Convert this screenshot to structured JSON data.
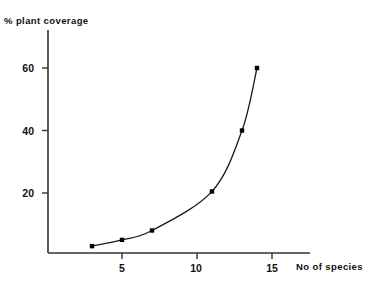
{
  "chart_data": {
    "type": "line",
    "title": "",
    "xlabel": "No of species",
    "ylabel": "% plant coverage",
    "xlim": [
      0,
      17.5
    ],
    "ylim": [
      0,
      72
    ],
    "xticks": [
      5,
      10,
      15
    ],
    "xtick_labels": [
      "5",
      "10",
      "15"
    ],
    "yticks": [
      20,
      40,
      60
    ],
    "ytick_labels": [
      "20",
      "40",
      "60"
    ],
    "grid": false,
    "legend": null,
    "marker": "filled-square",
    "line_color": "#1a1a1a",
    "marker_color": "#000000",
    "axis_color": "#333333",
    "series": [
      {
        "name": "plant coverage vs species",
        "x": [
          3,
          5,
          7,
          11,
          13,
          14
        ],
        "y": [
          3,
          5,
          8,
          20.5,
          40,
          60
        ]
      }
    ]
  },
  "axes": {
    "y_title": "% plant coverage",
    "x_title": "No of species",
    "y_tick_0": "20",
    "y_tick_1": "40",
    "y_tick_2": "60",
    "x_tick_0": "5",
    "x_tick_1": "10",
    "x_tick_2": "15"
  }
}
